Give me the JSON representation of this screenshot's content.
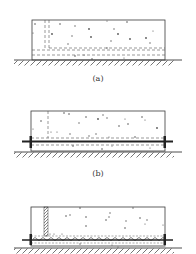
{
  "figure": {
    "panels": [
      {
        "id": "a",
        "caption": "(a)",
        "description": "Concrete slab on ground with dashed vertical and horizontal lines (formwork / joint outlines), no bar",
        "box": {
          "x": 32,
          "y": 20,
          "w": 133,
          "h": 40
        },
        "ground_y": 60,
        "caption_y": 73
      },
      {
        "id": "b",
        "caption": "(b)",
        "description": "Concrete slab with horizontal reinforcing bar through bottom zone, end plates",
        "box": {
          "x": 31,
          "y": 111,
          "w": 134,
          "h": 40
        },
        "ground_y": 152,
        "caption_y": 166
      },
      {
        "id": "c",
        "caption": "(c)",
        "description": "Concrete slab with hatched vertical strip and bar wrapped in grout / anchored zone along bottom",
        "box": {
          "x": 31,
          "y": 207,
          "w": 134,
          "h": 39
        },
        "ground_y": 248,
        "caption_y": null
      }
    ],
    "colors": {
      "line": "#3a3a3a",
      "dash": "#555555",
      "stipple": "#666666",
      "background": "#ffffff"
    }
  }
}
